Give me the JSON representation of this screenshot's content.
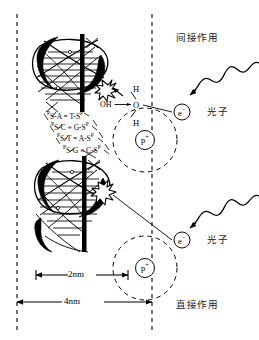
{
  "figure": {
    "title_alt": "DNA radiation damage: direct and indirect action",
    "background_color": "#ffffff",
    "line_color": "#000000",
    "width": 259,
    "height": 340
  },
  "regions": {
    "indirect_action_label": "间接作用",
    "direct_action_label": "直接作用"
  },
  "photons": [
    {
      "label": "光子"
    },
    {
      "label": "光子"
    }
  ],
  "atoms": [
    {
      "electron_label": "e",
      "electron_charge": "−",
      "proton_label": "p",
      "proton_charge": "+"
    },
    {
      "electron_label": "e",
      "electron_charge": "−",
      "proton_label": "p",
      "proton_charge": "+"
    }
  ],
  "water_molecule": {
    "oxygen": "O",
    "hydrogen_top": "H",
    "hydrogen_bottom": "H",
    "radical": "OH ·"
  },
  "dna": {
    "backbone_symbol": "S",
    "phosphate_symbol": "P",
    "base_pairs": [
      {
        "left_sugar": "S",
        "left_base": "A",
        "bond": "=",
        "right_base": "T",
        "right_sugar": "S"
      },
      {
        "left_sugar": "S",
        "left_base": "C",
        "bond": "≡",
        "right_base": "G",
        "right_sugar": "S"
      },
      {
        "left_sugar": "S",
        "left_base": "T",
        "bond": "=",
        "right_base": "A",
        "right_sugar": "S"
      },
      {
        "left_sugar": "S",
        "left_base": "G",
        "bond": "≡",
        "right_base": "C",
        "right_sugar": "S"
      }
    ],
    "rows_text": [
      "S-A = T-S",
      "S-C ≡ G-S",
      "S-T = A-S",
      "S-G ≡ C-S"
    ]
  },
  "scale_bars": {
    "inner": "2nm",
    "outer": "4nm"
  }
}
